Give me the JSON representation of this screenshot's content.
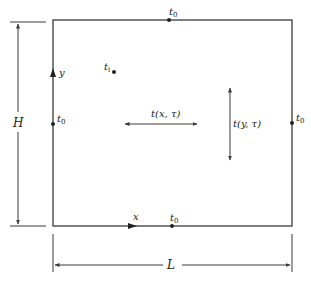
{
  "diagram": {
    "type": "2D rectangular plate conduction schematic",
    "colors": {
      "line": "#3a3a3a",
      "text": "#222222",
      "background": "#ffffff"
    },
    "boundary_labels": {
      "top": {
        "base": "t",
        "sub": "0"
      },
      "right": {
        "base": "t",
        "sub": "0"
      },
      "bottom": {
        "base": "t",
        "sub": "0"
      },
      "left": {
        "base": "t",
        "sub": "0"
      }
    },
    "interior_point": {
      "base": "t",
      "sub": "i"
    },
    "axes": {
      "x": "x",
      "y": "y"
    },
    "field_labels": {
      "horizontal": "t(x, τ)",
      "vertical": "t(y, τ)"
    },
    "dimensions": {
      "height": "H",
      "length": "L"
    }
  }
}
